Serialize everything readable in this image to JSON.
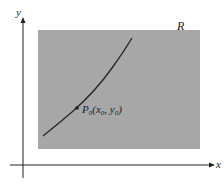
{
  "figure": {
    "region_label": "R",
    "x_axis_label": "x",
    "y_axis_label": "y",
    "point": {
      "name": "P",
      "sub": "0",
      "x_name": "x",
      "x_sub": "0",
      "y_name": "y",
      "y_sub": "0"
    },
    "colors": {
      "region": "#a6a6a6",
      "curve": "#2a2a2a",
      "axis": "#222222"
    }
  }
}
